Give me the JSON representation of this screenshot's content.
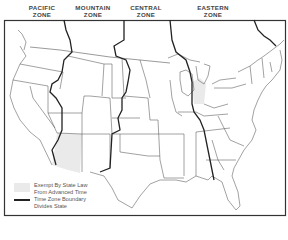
{
  "zones": [
    {
      "id": "pacific",
      "line1": "PACIFIC",
      "line2": "ZONE"
    },
    {
      "id": "mountain",
      "line1": "MOUNTAIN",
      "line2": "ZONE"
    },
    {
      "id": "central",
      "line1": "CENTRAL",
      "line2": "ZONE"
    },
    {
      "id": "eastern",
      "line1": "EASTERN",
      "line2": "ZONE"
    }
  ],
  "legend": {
    "exempt_line1": "Exempt By State Law",
    "exempt_line2": "From Advanced Time",
    "boundary_line1": "Time Zone Boundary",
    "boundary_line2": "Divides State"
  },
  "colors": {
    "exempt_fill": "#eaeaea",
    "state_line": "#555555",
    "zone_line": "#222222",
    "frame": "#333333"
  }
}
